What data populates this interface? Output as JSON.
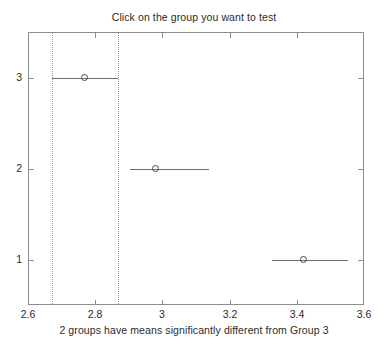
{
  "chart_data": {
    "type": "scatter",
    "title": "Click on the group you want to test",
    "caption": "2 groups have means significantly different from Group 3",
    "xlabel": "",
    "ylabel": "",
    "xlim": [
      2.6,
      3.6
    ],
    "ylim": [
      0.5,
      3.5
    ],
    "xticks": [
      "2.6",
      "2.8",
      "3",
      "3.2",
      "3.4",
      "3.6"
    ],
    "xtick_values": [
      2.6,
      2.8,
      3.0,
      3.2,
      3.4,
      3.6
    ],
    "yticks": [
      "1",
      "2",
      "3"
    ],
    "ytick_values": [
      1,
      2,
      3
    ],
    "grid": false,
    "legend": false,
    "reference_lines": {
      "style": "dotted",
      "color": "#9a9a9a",
      "values": [
        2.671,
        2.868
      ],
      "source_group": "3"
    },
    "series": [
      {
        "name": "Group 1",
        "group": 1,
        "mean": 3.42,
        "ci_low": 3.326,
        "ci_high": 3.553,
        "significant_vs_group3": true
      },
      {
        "name": "Group 2",
        "group": 2,
        "mean": 2.98,
        "ci_low": 2.904,
        "ci_high": 3.14,
        "significant_vs_group3": true
      },
      {
        "name": "Group 3",
        "group": 3,
        "mean": 2.77,
        "ci_low": 2.671,
        "ci_high": 2.868,
        "significant_vs_group3": false,
        "selected": true
      }
    ],
    "colors": {
      "axis": "#8d8d8d",
      "interval": "#6e6e6e",
      "marker": "#4a4a4a",
      "reference": "#9a9a9a",
      "text": "#2b2b2b",
      "background": "#ffffff"
    }
  }
}
